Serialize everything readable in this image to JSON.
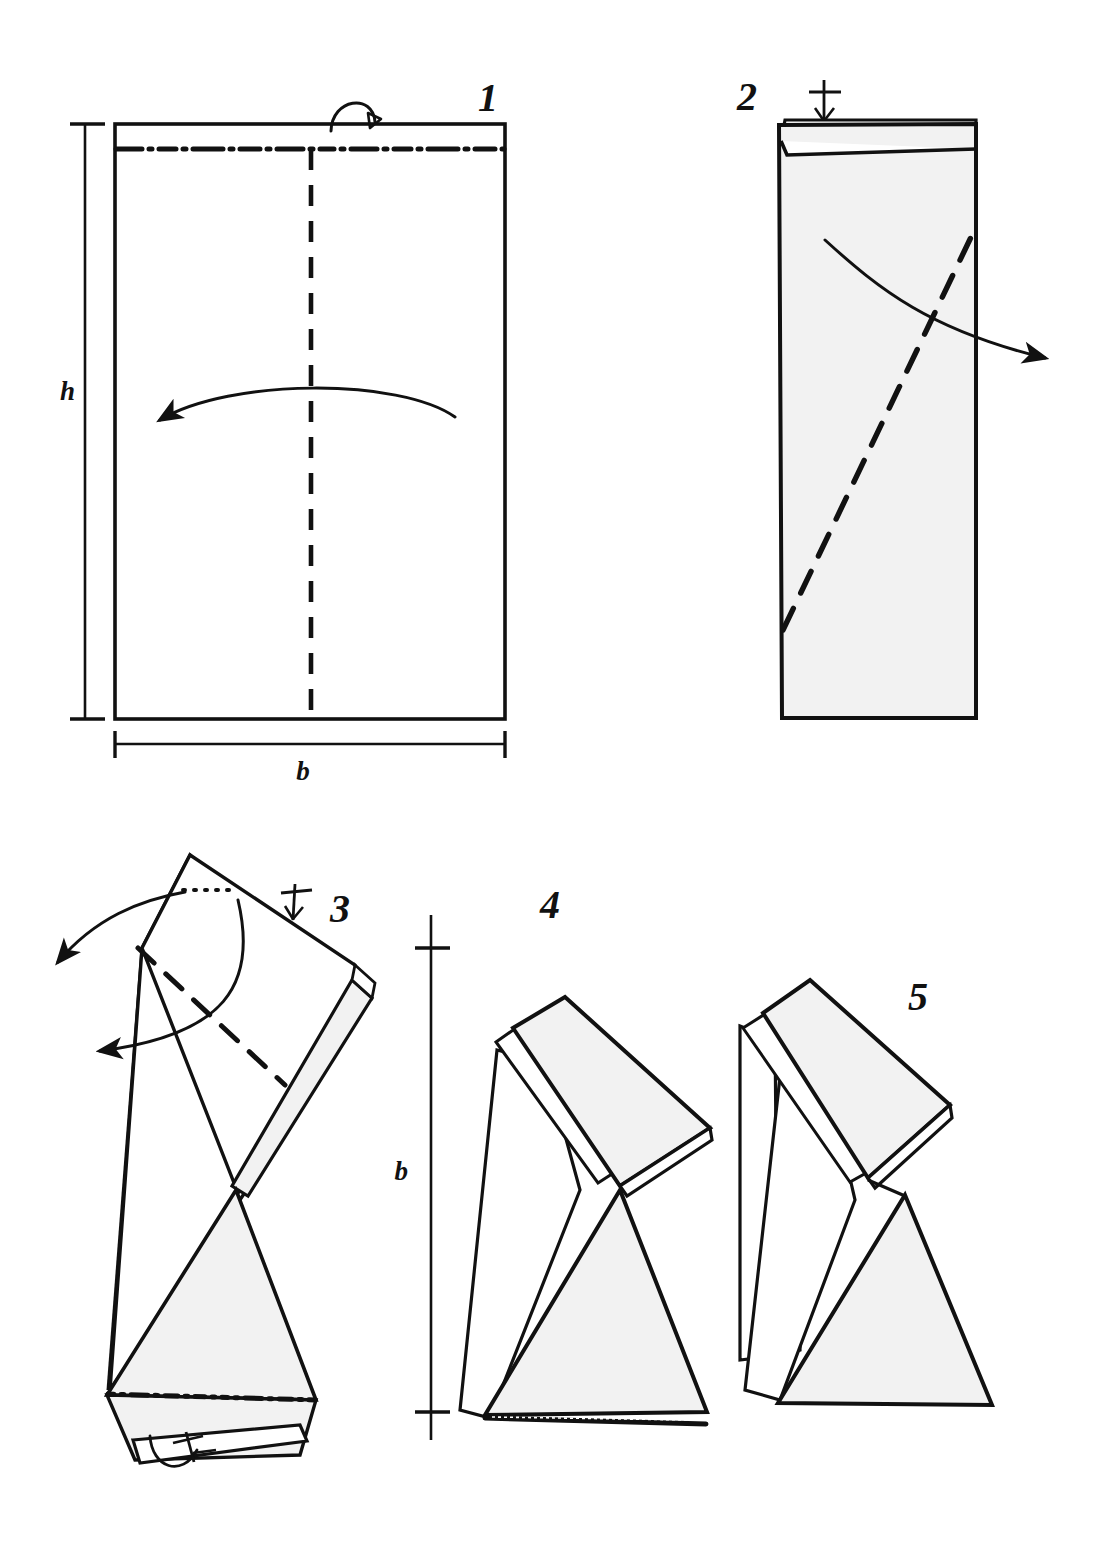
{
  "figure": {
    "kind": "origami-fold-sequence",
    "background_color": "#ffffff",
    "ink_color": "#111111",
    "paper_shade_color": "#f2f2f2",
    "step_count": 5
  },
  "steps": [
    {
      "number": "1",
      "label": "1",
      "description": "Flat rectangular sheet of paper, height h and width b, with a top folding strip marked by a dash-dot line and a vertical centre dashed fold line.",
      "dimensions": [
        {
          "name": "height",
          "label": "h"
        },
        {
          "name": "width",
          "label": "b"
        }
      ],
      "marks": [
        {
          "type": "dash-dot-line",
          "name": "top-strip-crease",
          "orientation": "horizontal"
        },
        {
          "type": "dashed-line",
          "name": "centre-fold-line",
          "orientation": "vertical"
        },
        {
          "type": "fold-over-arrow",
          "name": "top-strip-fold-arrow"
        },
        {
          "type": "curved-arrow",
          "name": "valley-fold-arrow",
          "direction": "left"
        }
      ]
    },
    {
      "number": "2",
      "label": "2",
      "description": "Sheet folded in half lengthwise with the narrow top strip turned down; a diagonal dashed fold line runs from the lower left to the upper right.",
      "marks": [
        {
          "type": "centre-tick",
          "name": "centre-mark-tick"
        },
        {
          "type": "dashed-line",
          "name": "diagonal-fold-line",
          "orientation": "diagonal"
        },
        {
          "type": "curved-arrow",
          "name": "fold-arrow",
          "direction": "right"
        }
      ]
    },
    {
      "number": "3",
      "label": "3",
      "description": "Paper after the diagonal fold, shown tilted. Two curved arrows point left, a dotted reference line and tick marks indicate the next creases.",
      "marks": [
        {
          "type": "dotted-line",
          "name": "reference-line"
        },
        {
          "type": "tick",
          "name": "alignment-tick-top"
        },
        {
          "type": "dashed-line",
          "name": "fold-line",
          "orientation": "diagonal"
        },
        {
          "type": "curved-arrow",
          "name": "unfold-arrow-upper",
          "direction": "left"
        },
        {
          "type": "curved-arrow",
          "name": "unfold-arrow-lower",
          "direction": "left"
        },
        {
          "type": "dash-dot-line",
          "name": "lower-crease"
        },
        {
          "type": "fold-under-arrow",
          "name": "bottom-tuck-arrow"
        },
        {
          "type": "tick",
          "name": "alignment-tick-bottom"
        }
      ]
    },
    {
      "number": "4",
      "label": "4",
      "description": "Resulting folded form standing on its base, the overall height equals the original width b.",
      "dimensions": [
        {
          "name": "height",
          "label": "b"
        }
      ],
      "marks": [
        {
          "type": "dimension-line",
          "name": "height-dimension-b"
        }
      ]
    },
    {
      "number": "5",
      "label": "5",
      "description": "Finished model seen from a slightly different angle, with the rear flap opened out to form a stable stand.",
      "marks": []
    }
  ],
  "dimension_labels": {
    "height_h": "h",
    "width_b": "b",
    "height_b": "b"
  }
}
